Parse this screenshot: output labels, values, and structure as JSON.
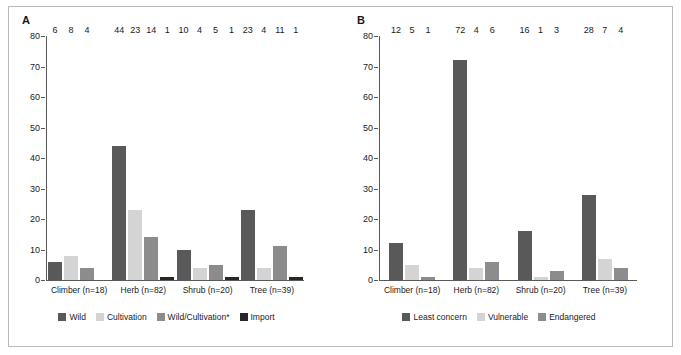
{
  "figure": {
    "panels": [
      {
        "letter": "A",
        "chart_index": 0
      },
      {
        "letter": "B",
        "chart_index": 1
      }
    ]
  },
  "chart_data": [
    {
      "type": "bar",
      "title": "A",
      "xlabel": "",
      "ylabel": "",
      "ylim": [
        0,
        80
      ],
      "yticks": [
        0,
        10,
        20,
        30,
        40,
        50,
        60,
        70,
        80
      ],
      "grid": false,
      "legend_position": "bottom",
      "categories": [
        "Climber (n=18)",
        "Herb (n=82)",
        "Shrub (n=20)",
        "Tree (n=39)"
      ],
      "series": [
        {
          "name": "Wild",
          "color": "#595959",
          "values": [
            6,
            44,
            10,
            23
          ]
        },
        {
          "name": "Cultivation",
          "color": "#d4d4d4",
          "values": [
            8,
            23,
            4,
            4
          ]
        },
        {
          "name": "Wild/Cultivation*",
          "color": "#8c8c8c",
          "values": [
            4,
            14,
            5,
            11
          ]
        },
        {
          "name": "Import",
          "color": "#262626",
          "values": [
            0,
            1,
            1,
            1
          ]
        }
      ]
    },
    {
      "type": "bar",
      "title": "B",
      "xlabel": "",
      "ylabel": "",
      "ylim": [
        0,
        80
      ],
      "yticks": [
        0,
        10,
        20,
        30,
        40,
        50,
        60,
        70,
        80
      ],
      "grid": false,
      "legend_position": "bottom",
      "categories": [
        "Climber (n=18)",
        "Herb (n=82)",
        "Shrub (n=20)",
        "Tree (n=39)"
      ],
      "series": [
        {
          "name": "Least concern",
          "color": "#595959",
          "values": [
            12,
            72,
            16,
            28
          ]
        },
        {
          "name": "Vulnerable",
          "color": "#d4d4d4",
          "values": [
            5,
            4,
            1,
            7
          ]
        },
        {
          "name": "Endangered",
          "color": "#8c8c8c",
          "values": [
            1,
            6,
            3,
            4
          ]
        }
      ]
    }
  ]
}
